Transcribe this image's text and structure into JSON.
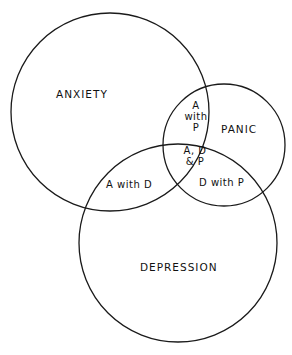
{
  "diagram": {
    "type": "venn",
    "sets": [
      {
        "id": "anxiety",
        "label": "ANXIETY"
      },
      {
        "id": "panic",
        "label": "PANIC"
      },
      {
        "id": "depression",
        "label": "DEPRESSION"
      }
    ],
    "intersections": {
      "anxiety_panic": [
        "A",
        "with",
        "P"
      ],
      "all_three": [
        "A, D",
        "& P"
      ],
      "anxiety_depression": "A with D",
      "depression_panic": "D with P"
    },
    "stroke_color": "#1a1a1a",
    "background": "#ffffff"
  }
}
